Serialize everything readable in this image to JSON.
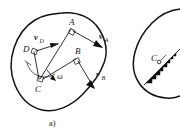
{
  "figure": {
    "caption": "a)",
    "panel_label_a": "a)",
    "points": [
      {
        "id": "A",
        "label": "A",
        "x": 72,
        "y": 26,
        "marker": "square"
      },
      {
        "id": "B",
        "label": "B",
        "x": 78,
        "y": 55,
        "marker": "square"
      },
      {
        "id": "C",
        "label": "C",
        "x": 40,
        "y": 82,
        "marker": "square"
      },
      {
        "id": "D",
        "label": "D",
        "x": 33,
        "y": 48,
        "marker": "square"
      }
    ],
    "vectors": [
      {
        "id": "vA",
        "base": "v",
        "subscript": "A",
        "label": "v",
        "sub": "A",
        "x": 104,
        "y": 40
      },
      {
        "id": "vB",
        "base": "v",
        "subscript": "B",
        "label": "v",
        "sub": "B",
        "x": 99,
        "y": 78
      },
      {
        "id": "vD",
        "base": "v",
        "subscript": "D",
        "label": "v",
        "sub": "D",
        "x": 39,
        "y": 40
      }
    ],
    "angular_velocity": {
      "symbol": "ω",
      "label": "ω",
      "x": 59,
      "y": 76
    },
    "second_panel": {
      "center_label": "C",
      "center_x": 155,
      "center_y": 62,
      "note": "velocity distribution wedges"
    },
    "colors": {
      "ink": "#121212",
      "line": "#1a1a1a",
      "paper": "#ffffff"
    }
  }
}
